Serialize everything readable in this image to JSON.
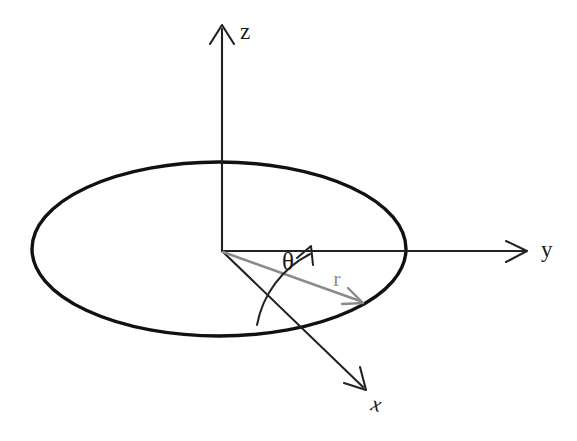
{
  "figure": {
    "title": "",
    "background_color": "#ffffff",
    "width": 577,
    "height": 441
  },
  "labels": {
    "z_axis": "z",
    "y_axis": "y",
    "x_axis": "x",
    "angle": "θ",
    "radius": "r"
  },
  "colors": {
    "axis": "#222222",
    "plane_outline": "#111111",
    "radius_vector": "#8b8b8b",
    "radius_label": "#8f8f8f",
    "text": "#1a1a1a",
    "background": "#ffffff"
  },
  "geometry": {
    "origin": {
      "x": 222,
      "y": 251
    },
    "z_axis": {
      "from_x": 222,
      "from_y": 251,
      "to_x": 222,
      "to_y": 26,
      "label_x": 247,
      "label_y": 34
    },
    "y_axis": {
      "from_x": 222,
      "from_y": 251,
      "to_x": 527,
      "to_y": 251,
      "label_x": 542,
      "label_y": 251
    },
    "x_axis": {
      "from_x": 222,
      "from_y": 251,
      "to_x": 366,
      "to_y": 390,
      "label_x": 376,
      "label_y": 404
    },
    "plane_ellipse": {
      "cx": 219,
      "cy": 249,
      "rx": 187,
      "ry": 87
    },
    "radius_vector": {
      "from_x": 222,
      "from_y": 251,
      "to_x": 363,
      "to_y": 303,
      "label_x": 337,
      "label_y": 281
    },
    "theta_arc": {
      "radius": 88,
      "start_deg": 20,
      "end_deg": 0,
      "label_x": 288,
      "label_y": 264
    }
  },
  "elements": {
    "plane": "xy-plane-disk",
    "vector": "radial-distance-vector",
    "angle_marker": "azimuthal-angle-arc"
  }
}
